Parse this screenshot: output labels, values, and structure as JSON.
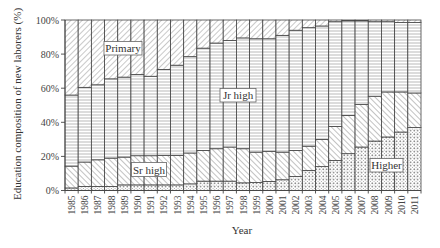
{
  "chart_data": {
    "type": "bar",
    "stacked": true,
    "percent": true,
    "title": "",
    "xlabel": "Year",
    "ylabel": "Education composition of new laborers (%)",
    "ylim": [
      0,
      100
    ],
    "yticks": [
      "0%",
      "20%",
      "40%",
      "60%",
      "80%",
      "100%"
    ],
    "grid": false,
    "legend": "inline labels",
    "categories": [
      "1985",
      "1986",
      "1987",
      "1988",
      "1989",
      "1990",
      "1991",
      "1992",
      "1993",
      "1994",
      "1995",
      "1996",
      "1997",
      "1998",
      "1999",
      "2000",
      "2001",
      "2002",
      "2003",
      "2004",
      "2005",
      "2006",
      "2007",
      "2008",
      "2009",
      "2010",
      "2011"
    ],
    "series": [
      {
        "name": "Higher",
        "pattern": "dots",
        "values": [
          1.5,
          2.4,
          2.4,
          2.4,
          3.3,
          3.3,
          3.3,
          3.3,
          3.3,
          3.9,
          5.5,
          5.5,
          5.5,
          4.5,
          4.7,
          5.3,
          6.3,
          8.2,
          11.8,
          14.0,
          17.6,
          21.6,
          25.5,
          29.0,
          31.4,
          34.3,
          36.9
        ]
      },
      {
        "name": "Sr high",
        "pattern": "back-diagonal",
        "values": [
          12.8,
          14.3,
          15.6,
          16.6,
          16.3,
          17.1,
          17.1,
          17.3,
          17.3,
          18.1,
          18.0,
          19.0,
          20.0,
          20.0,
          17.8,
          17.7,
          16.2,
          15.3,
          14.2,
          16.0,
          20.0,
          22.4,
          24.9,
          26.3,
          26.4,
          23.5,
          20.3
        ]
      },
      {
        "name": "Jr high",
        "pattern": "horizontal",
        "values": [
          41.7,
          43.8,
          44.0,
          46.5,
          46.9,
          47.6,
          46.6,
          50.4,
          52.9,
          56.5,
          60.0,
          62.0,
          62.5,
          65.0,
          66.5,
          66.0,
          68.5,
          70.5,
          69.5,
          66.5,
          61.4,
          55.5,
          49.1,
          43.7,
          41.2,
          40.7,
          41.3
        ]
      },
      {
        "name": "Primary",
        "pattern": "forward-diagonal",
        "values": [
          44.0,
          39.5,
          38.0,
          34.5,
          33.5,
          32.0,
          33.0,
          29.0,
          26.5,
          21.5,
          16.5,
          13.5,
          12.0,
          10.5,
          11.0,
          11.0,
          9.0,
          6.0,
          4.5,
          3.5,
          1.0,
          0.5,
          0.5,
          1.0,
          1.0,
          1.5,
          1.5
        ]
      }
    ],
    "annotations": [
      {
        "text": "Primary",
        "series": "Primary"
      },
      {
        "text": "Jr high",
        "series": "Jr high"
      },
      {
        "text": "Sr high",
        "series": "Sr high"
      },
      {
        "text": "Higher",
        "series": "Higher"
      }
    ]
  },
  "labels": {
    "primary": "Primary",
    "jr_high": "Jr high",
    "sr_high": "Sr high",
    "higher": "Higher"
  },
  "axes": {
    "xlabel": "Year",
    "ylabel": "Education composition of new laborers (%)"
  }
}
